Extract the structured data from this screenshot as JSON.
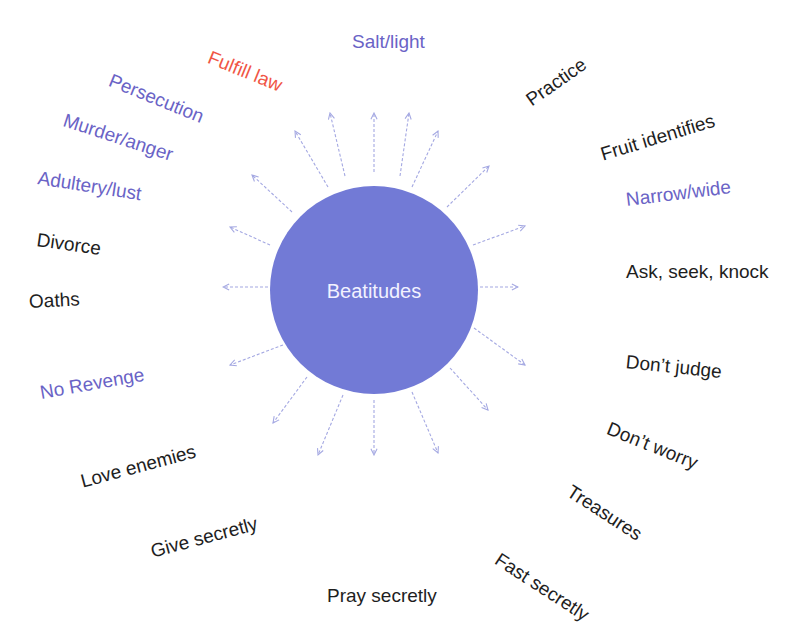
{
  "diagram": {
    "center": {
      "label": "Beatitudes",
      "color": "#727ad6",
      "text_color": "#f2f2ff"
    },
    "arrow_color": "#a4a8e2",
    "colors": {
      "purple": "#6a63c6",
      "red": "#f05545",
      "black": "#1e1e1e"
    },
    "labels": [
      {
        "text": "Salt/light",
        "color": "purple"
      },
      {
        "text": "Fulfill law",
        "color": "red"
      },
      {
        "text": "Persecution",
        "color": "purple"
      },
      {
        "text": "Murder/anger",
        "color": "purple"
      },
      {
        "text": "Adultery/lust",
        "color": "purple"
      },
      {
        "text": "Divorce",
        "color": "black"
      },
      {
        "text": "Oaths",
        "color": "black"
      },
      {
        "text": "No Revenge",
        "color": "purple"
      },
      {
        "text": "Love enemies",
        "color": "black"
      },
      {
        "text": "Give secretly",
        "color": "black"
      },
      {
        "text": "Pray secretly",
        "color": "black"
      },
      {
        "text": "Fast secretly",
        "color": "black"
      },
      {
        "text": "Treasures",
        "color": "black"
      },
      {
        "text": "Don’t worry",
        "color": "black"
      },
      {
        "text": "Don’t judge",
        "color": "black"
      },
      {
        "text": "Ask, seek, knock",
        "color": "black"
      },
      {
        "text": "Narrow/wide",
        "color": "purple"
      },
      {
        "text": "Fruit identifies",
        "color": "black"
      },
      {
        "text": "Practice",
        "color": "black"
      }
    ]
  }
}
